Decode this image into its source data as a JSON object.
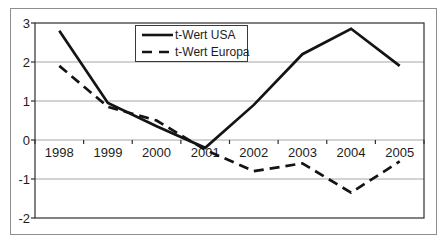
{
  "chart_data": {
    "type": "line",
    "title": "",
    "xlabel": "",
    "ylabel": "",
    "categories": [
      "1998",
      "1999",
      "2000",
      "2001",
      "2002",
      "2003",
      "2004",
      "2005"
    ],
    "series": [
      {
        "name": "t-Wert USA",
        "style": "solid",
        "color": "#141414",
        "values": [
          2.8,
          0.95,
          0.35,
          -0.2,
          0.9,
          2.2,
          2.85,
          1.9
        ]
      },
      {
        "name": "t-Wert Europa",
        "style": "dashed",
        "color": "#141414",
        "values": [
          1.9,
          0.85,
          0.5,
          -0.25,
          -0.8,
          -0.6,
          -1.35,
          -0.55
        ]
      }
    ],
    "ylim": [
      -2,
      3
    ],
    "y_ticks": [
      3,
      2,
      1,
      0,
      -1,
      -2
    ],
    "grid": true,
    "x_axis_crosses_at": 0,
    "legend_position": "top-center",
    "colors": {
      "outer_border": "#8d8d8d",
      "gridline": "#a6a6a6",
      "axis": "#2f2f2f",
      "text": "#1c1c1c",
      "background": "#ffffff"
    }
  }
}
